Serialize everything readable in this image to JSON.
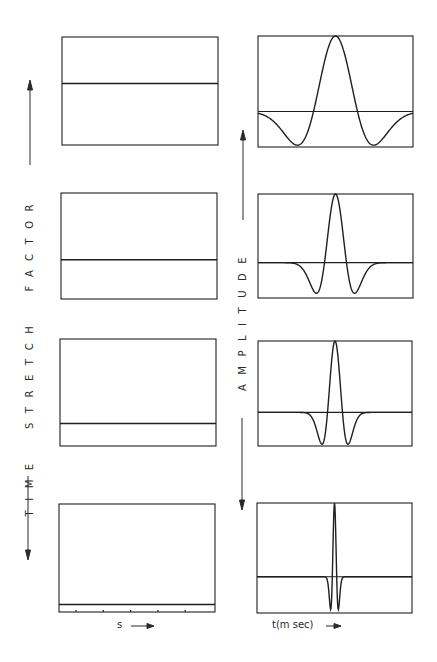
{
  "labels": {
    "left_axis": "TIME  STRETCH  FACTOR",
    "right_axis": "AMPLITUDE",
    "left_xlabel": "s",
    "right_xlabel": "t(m sec)"
  },
  "colors": {
    "ink": "#1f1f1f",
    "background": "#ffffff"
  },
  "chart_data": [
    {
      "type": "line",
      "title": "Time stretch factor vs s (four panels, top to bottom)",
      "xlabel": "s",
      "ylabel": "Time stretch factor",
      "panels": [
        {
          "panel": 1,
          "level_fraction_from_top": 0.43
        },
        {
          "panel": 2,
          "level_fraction_from_top": 0.63
        },
        {
          "panel": 3,
          "level_fraction_from_top": 0.79
        },
        {
          "panel": 4,
          "level_fraction_from_top": 0.93
        }
      ],
      "x_ticks_count": 5,
      "legend": "none"
    },
    {
      "type": "line",
      "title": "Wavelet amplitude vs t (four panels, top to bottom)",
      "xlabel": "t(m sec)",
      "ylabel": "Amplitude",
      "panels": [
        {
          "panel": 1,
          "shape": "ricker",
          "relative_width": 1.0,
          "baseline_fraction_from_top": 0.68
        },
        {
          "panel": 2,
          "shape": "ricker",
          "relative_width": 0.5,
          "baseline_fraction_from_top": 0.66
        },
        {
          "panel": 3,
          "shape": "ricker",
          "relative_width": 0.34,
          "baseline_fraction_from_top": 0.68
        },
        {
          "panel": 4,
          "shape": "ricker",
          "relative_width": 0.1,
          "baseline_fraction_from_top": 0.67
        }
      ],
      "legend": "none"
    }
  ]
}
